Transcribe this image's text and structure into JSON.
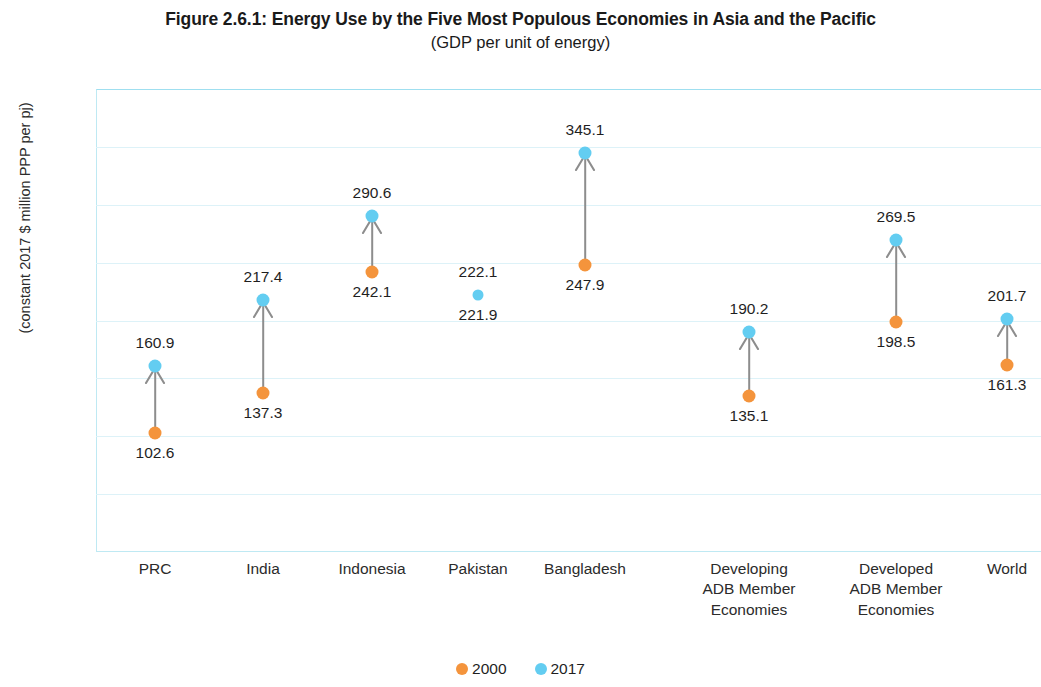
{
  "chart_data": {
    "type": "scatter",
    "title": "Figure 2.6.1:  Energy Use by the Five  Most Populous Economies in Asia and the Pacific",
    "subtitle": "(GDP per unit of energy)",
    "ylabel": "(constant 2017 $ million PPP per pj)",
    "xlabel": "",
    "ylim": [
      0,
      400
    ],
    "ytick_step": 50,
    "yticks": [
      "400",
      "350",
      "300",
      "250",
      "200",
      "150",
      "100",
      "50",
      "0"
    ],
    "grid": true,
    "legend_position": "bottom",
    "categories": [
      "PRC",
      "India",
      "Indonesia",
      "Pakistan",
      "Bangladesh",
      "Developing\nADB Member\nEconomies",
      "Developed\nADB Member\nEconomies",
      "World"
    ],
    "series": [
      {
        "name": "2000",
        "color": "#f4943c",
        "values": [
          102.6,
          137.3,
          242.1,
          221.9,
          247.9,
          135.1,
          198.5,
          161.3
        ]
      },
      {
        "name": "2017",
        "color": "#63cdf1",
        "values": [
          160.9,
          217.4,
          290.6,
          222.1,
          345.1,
          190.2,
          269.5,
          201.7
        ]
      }
    ],
    "point_labels": {
      "2000": [
        "102.6",
        "137.3",
        "242.1",
        "221.9",
        "247.9",
        "135.1",
        "198.5",
        "161.3"
      ],
      "2017": [
        "160.9",
        "217.4",
        "290.6",
        "222.1",
        "345.1",
        "190.2",
        "269.5",
        "201.7"
      ]
    },
    "annotations": [
      {
        "category": "PRC",
        "from": 102.6,
        "to": 160.9,
        "direction": "up"
      },
      {
        "category": "India",
        "from": 137.3,
        "to": 217.4,
        "direction": "up"
      },
      {
        "category": "Indonesia",
        "from": 242.1,
        "to": 290.6,
        "direction": "up"
      },
      {
        "category": "Pakistan",
        "from": 221.9,
        "to": 222.1,
        "direction": "up"
      },
      {
        "category": "Bangladesh",
        "from": 247.9,
        "to": 345.1,
        "direction": "up"
      },
      {
        "category": "Developing ADB Member Economies",
        "from": 135.1,
        "to": 190.2,
        "direction": "up"
      },
      {
        "category": "Developed ADB Member Economies",
        "from": 198.5,
        "to": 269.5,
        "direction": "up"
      },
      {
        "category": "World",
        "from": 161.3,
        "to": 201.7,
        "direction": "up"
      }
    ],
    "colors": {
      "series_2000": "#f4943c",
      "series_2017": "#63cdf1",
      "grid": "#ddf2f8",
      "axis": "#bfe9f3",
      "arrow": "#8d8d8d",
      "text": "#1f1f1f"
    }
  },
  "legend": {
    "items": [
      {
        "label": "2000",
        "color": "#f4943c"
      },
      {
        "label": "2017",
        "color": "#63cdf1"
      }
    ]
  }
}
